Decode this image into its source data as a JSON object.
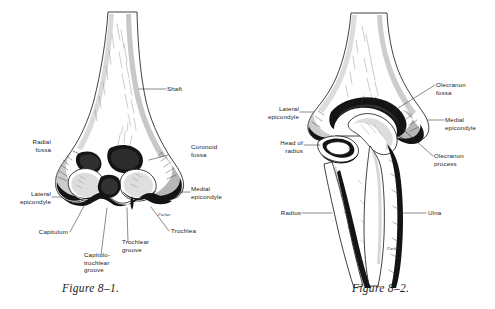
{
  "page": {
    "background_color": "#ffffff",
    "ink_color": "#1a1a1a",
    "type": "anatomical-illustration-plate"
  },
  "figure_1": {
    "caption": "Figure 8–1.",
    "subject": "Distal humerus, anterior view",
    "signature": "Parker",
    "labels": [
      {
        "id": "shaft",
        "text": "Shaft",
        "align": "left"
      },
      {
        "id": "radial-fossa",
        "text": "Radial\nfossa",
        "align": "right"
      },
      {
        "id": "coronoid-fossa",
        "text": "Coronoid\nfossa",
        "align": "left"
      },
      {
        "id": "lateral-epicondyle",
        "text": "Lateral\nepicondyle",
        "align": "right"
      },
      {
        "id": "medial-epicondyle",
        "text": "Medial\nepicondyle",
        "align": "left"
      },
      {
        "id": "capitulum",
        "text": "Capitulum",
        "align": "right"
      },
      {
        "id": "capitulo-troch-groove",
        "text": "Capitulo-\ntrochlear\ngroove",
        "align": "left"
      },
      {
        "id": "trochlear-groove",
        "text": "Trochlear\ngroove",
        "align": "left"
      },
      {
        "id": "trochlea",
        "text": "Trochlea",
        "align": "left"
      }
    ]
  },
  "figure_2": {
    "caption": "Figure 8–2.",
    "subject": "Elbow joint, posterior view",
    "signature": "Parker",
    "labels": [
      {
        "id": "olecranon-fossa",
        "text": "Olecranon\nfossa",
        "align": "left"
      },
      {
        "id": "lateral-epicondyle",
        "text": "Lateral\nepicondyle",
        "align": "right"
      },
      {
        "id": "medial-epicondyle",
        "text": "Medial\nepicondyle",
        "align": "left"
      },
      {
        "id": "head-of-radius",
        "text": "Head of\nradius",
        "align": "right"
      },
      {
        "id": "olecranon-process",
        "text": "Olecranon\nprocess",
        "align": "left"
      },
      {
        "id": "radius",
        "text": "Radius",
        "align": "right"
      },
      {
        "id": "ulna",
        "text": "Ulna",
        "align": "left"
      }
    ]
  }
}
